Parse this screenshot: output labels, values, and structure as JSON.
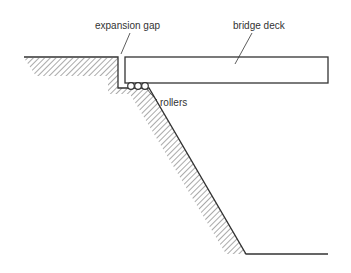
{
  "diagram": {
    "type": "bridge-abutment-cross-section",
    "labels": {
      "expansion_gap": "expansion gap",
      "bridge_deck": "bridge deck",
      "rollers": "rollers"
    },
    "colors": {
      "line": "#333333",
      "hatch": "#555555",
      "background": "#ffffff"
    },
    "roller_count": 3
  }
}
